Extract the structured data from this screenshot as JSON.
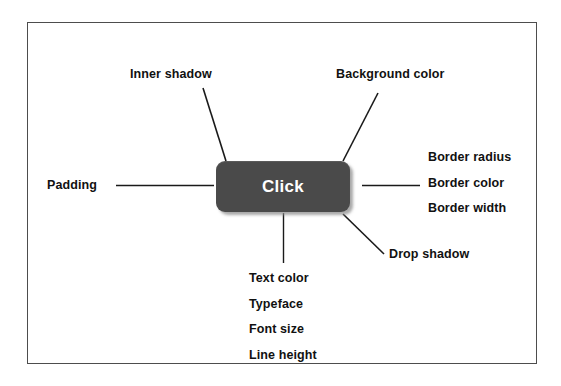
{
  "diagram": {
    "title_text": null,
    "frame": {
      "border_color": "#4d4d4d"
    },
    "button": {
      "label": "Click",
      "background_color": "#4a4a4a",
      "text_color": "#ffffff",
      "border_radius_px": 9
    },
    "annotations": {
      "inner_shadow": "Inner shadow",
      "background_color": "Background color",
      "padding": "Padding",
      "drop_shadow": "Drop shadow",
      "border_group": [
        "Border radius",
        "Border color",
        "Border width"
      ],
      "text_group": [
        "Text color",
        "Typeface",
        "Font size",
        "Line height"
      ]
    },
    "connector_color": "#1a1a1a"
  }
}
